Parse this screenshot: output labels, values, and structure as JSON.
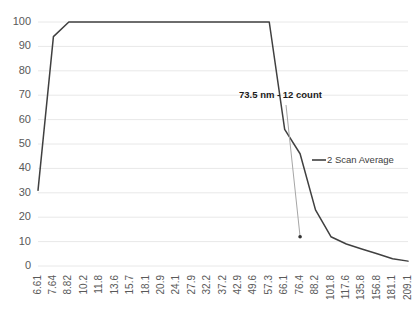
{
  "chart_data": {
    "type": "line",
    "title": "",
    "xlabel": "",
    "ylabel": "",
    "ylim": [
      0,
      100
    ],
    "ytick_values": [
      0,
      10,
      20,
      30,
      40,
      50,
      60,
      70,
      80,
      90,
      100
    ],
    "grid": true,
    "legend_position": "center-right",
    "categories": [
      "6.61",
      "7.64",
      "8.82",
      "10.2",
      "11.8",
      "13.6",
      "15.7",
      "18.1",
      "20.9",
      "24.1",
      "27.9",
      "32.2",
      "37.2",
      "42.9",
      "49.6",
      "57.3",
      "66.1",
      "76.4",
      "88.2",
      "101.8",
      "117.6",
      "135.8",
      "156.8",
      "181.1",
      "209.1"
    ],
    "series": [
      {
        "name": "2 Scan Average",
        "color": "#404040",
        "values": [
          31,
          94,
          100,
          100,
          100,
          100,
          100,
          100,
          100,
          100,
          100,
          100,
          100,
          100,
          100,
          100,
          56,
          46,
          23,
          12,
          9,
          7,
          5,
          3,
          2
        ]
      }
    ],
    "annotations": [
      {
        "label": "73.5 nm - 12 count",
        "x_value": "73.5",
        "y_value": 12,
        "units": "nm",
        "count": 12
      }
    ]
  },
  "legend": {
    "entries": [
      {
        "label": "2 Scan Average"
      }
    ]
  },
  "axis": {
    "y_labels": [
      "100",
      "90",
      "80",
      "70",
      "60",
      "50",
      "40",
      "30",
      "20",
      "10",
      "0"
    ],
    "x_labels": [
      "6.61",
      "7.64",
      "8.82",
      "10.2",
      "11.8",
      "13.6",
      "15.7",
      "18.1",
      "20.9",
      "24.1",
      "27.9",
      "32.2",
      "37.2",
      "42.9",
      "49.6",
      "57.3",
      "66.1",
      "76.4",
      "88.2",
      "101.8",
      "117.6",
      "135.8",
      "156.8",
      "181.1",
      "209.1"
    ]
  },
  "annotation": {
    "text": "73.5 nm - 12 count"
  },
  "colors": {
    "series": "#404040",
    "grid": "#e8e8e8",
    "tick_text": "#595959",
    "leader": "#a6a6a6",
    "background": "#ffffff"
  }
}
